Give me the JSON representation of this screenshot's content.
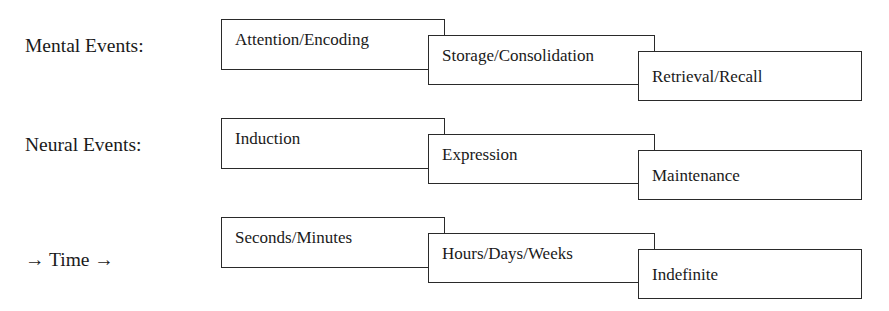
{
  "rows": [
    {
      "label": "Mental Events:",
      "boxes": [
        {
          "text": "Attention/Encoding"
        },
        {
          "text": "Storage/Consolidation"
        },
        {
          "text": "Retrieval/Recall"
        }
      ]
    },
    {
      "label": "Neural Events:",
      "boxes": [
        {
          "text": "Induction"
        },
        {
          "text": "Expression"
        },
        {
          "text": "Maintenance"
        }
      ]
    },
    {
      "label": "→ Time →",
      "boxes": [
        {
          "text": "Seconds/Minutes"
        },
        {
          "text": "Hours/Days/Weeks"
        },
        {
          "text": "Indefinite"
        }
      ]
    }
  ]
}
